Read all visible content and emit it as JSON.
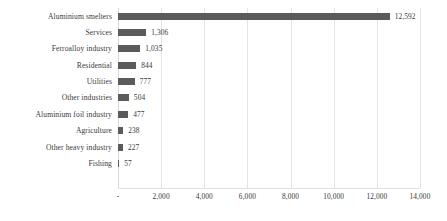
{
  "chart_data": {
    "type": "bar",
    "orientation": "horizontal",
    "title": "",
    "subtitle": "",
    "xlabel": "",
    "ylabel": "",
    "xlim": [
      0,
      14000
    ],
    "grid": true,
    "legend": false,
    "legend_position": "none",
    "bar_color": "#5b5b5b",
    "gridline_color": "#e4e4e4",
    "background_color": "#ffffff",
    "tick_labels": [
      "-",
      "2,000",
      "4,000",
      "6,000",
      "8,000",
      "10,000",
      "12,000",
      "14,000"
    ],
    "tick_values": [
      0,
      2000,
      4000,
      6000,
      8000,
      10000,
      12000,
      14000
    ],
    "categories": [
      "Aluminium smelters",
      "Services",
      "Ferroalloy industry",
      "Residential",
      "Utilities",
      "Other industries",
      "Aluminium foil industry",
      "Agriculture",
      "Other heavy industry",
      "Fishing"
    ],
    "values": [
      12592,
      1306,
      1035,
      844,
      777,
      504,
      477,
      238,
      227,
      57
    ],
    "value_labels": [
      "12,592",
      "1,306",
      "1,035",
      "844",
      "777",
      "504",
      "477",
      "238",
      "227",
      "57"
    ]
  }
}
